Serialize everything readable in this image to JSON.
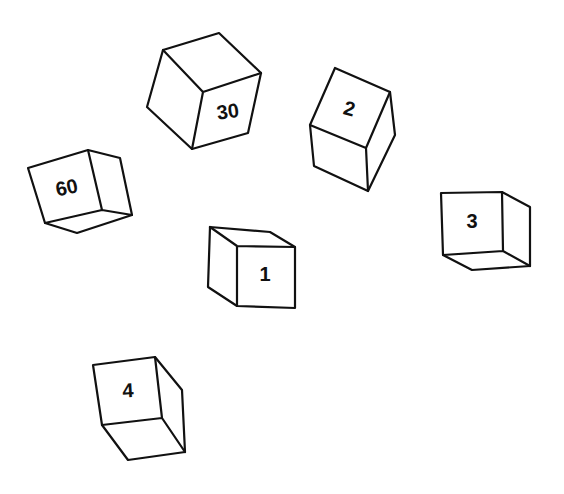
{
  "figure": {
    "stroke_color": "#111111",
    "background": "#ffffff"
  },
  "cubes": [
    {
      "id": "cube-30",
      "label": "30",
      "outline": "163,50 219,33 261,73 248,133 192,149 147,107",
      "inner_edges": "163,50 203,92 261,73 M203,92 192,149",
      "label_x": 228,
      "label_y": 113,
      "label_rotate": -8
    },
    {
      "id": "cube-2",
      "label": "2",
      "outline": "335,68 390,92 395,135 368,191 314,166 310,125",
      "inner_edges": "310,125 366,148 390,92 M366,148 368,191",
      "label_x": 349,
      "label_y": 110,
      "label_rotate": 15
    },
    {
      "id": "cube-60",
      "label": "60",
      "outline": "28,168 88,150 120,158 132,215 77,233 45,223",
      "inner_edges": "88,150 102,210 45,223 M102,210 132,215",
      "label_x": 67,
      "label_y": 189,
      "label_rotate": -12
    },
    {
      "id": "cube-1",
      "label": "1",
      "outline": "210,227 270,232 295,247 295,308 237,306 208,287",
      "inner_edges": "210,227 237,246 295,247 M237,246 237,306",
      "label_x": 265,
      "label_y": 276,
      "label_rotate": 0
    },
    {
      "id": "cube-3",
      "label": "3",
      "outline": "441,193 502,192 530,207 530,266 472,270 443,255",
      "inner_edges": "502,192 503,251 443,255 M503,251 530,266",
      "label_x": 472,
      "label_y": 223,
      "label_rotate": 0
    },
    {
      "id": "cube-4",
      "label": "4",
      "outline": "93,365 155,357 182,390 185,452 128,460 102,425",
      "inner_edges": "155,357 162,418 102,425 M162,418 185,452",
      "label_x": 128,
      "label_y": 392,
      "label_rotate": -3
    }
  ]
}
